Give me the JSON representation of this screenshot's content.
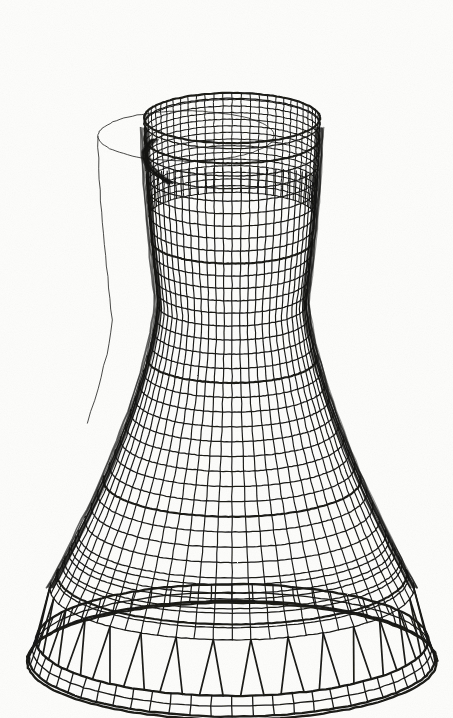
{
  "figure": {
    "render_style": "wireframe-mesh",
    "medium": "scanned line drawing",
    "background_color": "#fdfdfb",
    "ink_color": "#1a1a18",
    "reference_outline_color": "#2a2a28",
    "canvas": {
      "width": 453,
      "height": 718
    }
  },
  "view": {
    "projection": "axonometric",
    "center_x": 232,
    "ellipse_squash": 0.285,
    "camera_elevation_note": "viewed from slightly above; top opening visible",
    "drawing_bounds": {
      "left": 28,
      "right": 426,
      "top": 31,
      "bottom": 687
    }
  },
  "geometry": {
    "shape_type": "hyperboloid-of-one-sheet",
    "top_rim": {
      "center_y": 118,
      "radius_x": 88,
      "label": "throat top rim"
    },
    "throat": {
      "center_y": 300,
      "radius_x": 74,
      "label": "narrowest waist"
    },
    "shell_base": {
      "center_y": 588,
      "radius_x": 182,
      "label": "shell lower edge"
    },
    "ring_beam": {
      "center_y": 640,
      "radius_x": 196,
      "label": "foundation ring beam"
    },
    "waist_y_fraction": 0.4,
    "profile_exponent": 2.35
  },
  "mesh": {
    "meridian_count": 60,
    "hoop_count": 34,
    "back_wall_hoop_count": 15,
    "element_type": "quadrilateral shell elements",
    "heavy_hoop_indices": [
      0,
      8,
      17,
      26,
      33
    ],
    "visible_front_meridians": 31,
    "back_wall_visible": true
  },
  "supports": {
    "type": "V-shaped diagonal columns",
    "pair_count": 30,
    "leg_spread": 11,
    "top_y": 588,
    "bottom_y": 640,
    "description": "paired raker columns between shell base and ring beam"
  },
  "base_ring": {
    "band_height": 34,
    "circumferential_divisions": 60,
    "radial_divisions": 2,
    "label": "meshed annular foundation ring"
  },
  "reference_outline": {
    "visible": true,
    "offset_x": -46,
    "offset_y": 18,
    "description": "faint undeformed reference silhouette offset to the left",
    "segments": [
      "top rim ellipse",
      "left meridian generatrix"
    ]
  },
  "shading": {
    "silhouette_darkening": true,
    "left_edge_dark": true,
    "right_edge_dark": true,
    "note": "mesh lines converge at silhouettes producing dark bands"
  },
  "labels": {
    "caption": "",
    "annotations": []
  }
}
